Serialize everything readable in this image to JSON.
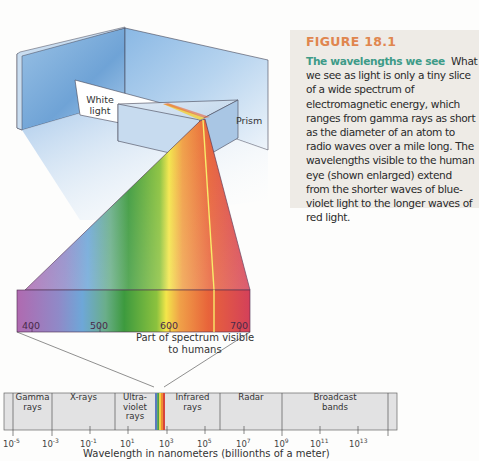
{
  "figure": {
    "number": "FIGURE 18.1",
    "title": "The wavelengths we see",
    "body": "What we see as light is only a tiny slice of a wide spectrum of electromagnetic energy, which ranges from gamma rays as short as the diameter of an atom to radio waves over a mile long. The wavelengths visible to the human eye (shown enlarged) extend from the shorter waves of blue-violet light to the longer waves of red light.",
    "colors": {
      "figure_number": "#e0864e",
      "title": "#3e9b88",
      "caption_bg": "#eeebe6"
    }
  },
  "labels": {
    "white_light_line1": "White",
    "white_light_line2": "light",
    "prism": "Prism",
    "visible_line1": "Part of spectrum visible",
    "visible_line2": "to humans"
  },
  "visible_spectrum": {
    "ticks": [
      "400",
      "500",
      "600",
      "700"
    ],
    "unit": "nm"
  },
  "bands": [
    {
      "line1": "Gamma",
      "line2": "rays",
      "line3": ""
    },
    {
      "line1": "X-rays",
      "line2": "",
      "line3": ""
    },
    {
      "line1": "Ultra-",
      "line2": "violet",
      "line3": "rays"
    },
    {
      "line1": "Infrared",
      "line2": "rays",
      "line3": ""
    },
    {
      "line1": "Radar",
      "line2": "",
      "line3": ""
    },
    {
      "line1": "Broadcast",
      "line2": "bands",
      "line3": ""
    }
  ],
  "axis": {
    "base": "10",
    "exponents": [
      "-5",
      "-3",
      "-1",
      "1",
      "3",
      "5",
      "7",
      "9",
      "11",
      "13"
    ],
    "title": "Wavelength in nanometers (billionths of a meter)"
  }
}
